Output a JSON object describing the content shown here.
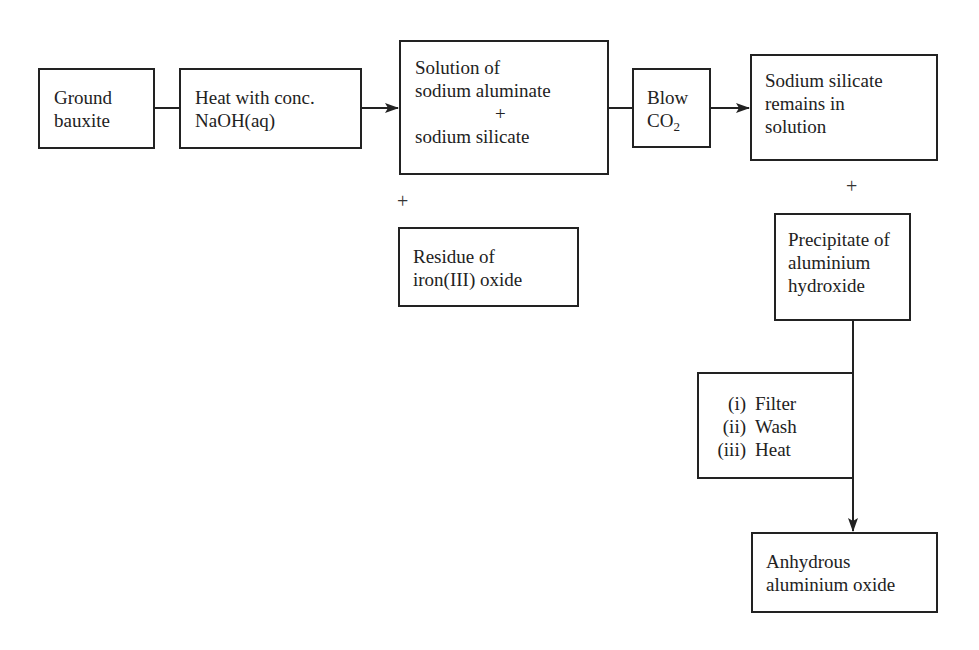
{
  "diagram": {
    "title": "",
    "nodes": {
      "ground_bauxite": {
        "lines": [
          "Ground",
          "bauxite"
        ]
      },
      "heat_naoh": {
        "lines": [
          "Heat with conc.",
          "NaOH(aq)"
        ]
      },
      "solution": {
        "line1": "Solution of",
        "line2": "sodium aluminate",
        "plus": "+",
        "line4": "sodium silicate"
      },
      "blow_co2": {
        "line1": "Blow",
        "line2_main": "CO",
        "line2_sub": "2"
      },
      "sodium_silicate_remains": {
        "lines": [
          "Sodium silicate",
          "remains in",
          "solution"
        ]
      },
      "residue": {
        "lines": [
          "Residue of",
          "iron(III) oxide"
        ]
      },
      "precipitate": {
        "lines": [
          "Precipitate of",
          "aluminium",
          "hydroxide"
        ]
      },
      "steps": {
        "items": [
          {
            "num": "(i)",
            "label": "Filter"
          },
          {
            "num": "(ii)",
            "label": "Wash"
          },
          {
            "num": "(iii)",
            "label": "Heat"
          }
        ]
      },
      "anhydrous": {
        "lines": [
          "Anhydrous",
          "aluminium oxide"
        ]
      }
    },
    "connectors": {
      "plus_residue": "+",
      "plus_precipitate": "+"
    },
    "edges": [
      {
        "from": "ground_bauxite",
        "to": "heat_naoh",
        "arrow": false
      },
      {
        "from": "heat_naoh",
        "to": "solution",
        "arrow": true
      },
      {
        "from": "solution",
        "to": "blow_co2",
        "arrow": false
      },
      {
        "from": "blow_co2",
        "to": "sodium_silicate_remains",
        "arrow": true
      },
      {
        "from": "precipitate",
        "to": "steps",
        "arrow": false
      },
      {
        "from": "steps",
        "to": "anhydrous",
        "arrow": true
      }
    ],
    "colors": {
      "stroke": "#222222",
      "background": "#ffffff"
    }
  }
}
